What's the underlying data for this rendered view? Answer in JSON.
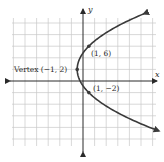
{
  "chart_data": {
    "type": "line",
    "title": "",
    "xlabel": "x",
    "ylabel": "y",
    "equation": "x = (y - 2)^2 / 8 - 1",
    "grid": true,
    "grid_step_units": 2,
    "xlim": [
      -12,
      12
    ],
    "ylim": [
      -12,
      12
    ],
    "series": [
      {
        "name": "parabola",
        "opens": "right",
        "y": [
          -8.5,
          -6,
          -4,
          -2,
          0,
          2,
          4,
          6,
          8,
          10,
          11.5
        ],
        "x": [
          12.78,
          7,
          3.5,
          1,
          -0.5,
          -1,
          -0.5,
          1,
          3.5,
          7,
          10.28
        ]
      }
    ],
    "points": [
      {
        "label": "Vertex (−1, 2)",
        "x": -1,
        "y": 2
      },
      {
        "label": "(1, 6)",
        "x": 1,
        "y": 6
      },
      {
        "label": "(1, −2)",
        "x": 1,
        "y": -2
      }
    ],
    "annotations": [
      "Vertex (−1, 2)",
      "(1, 6)",
      "(1, −2)"
    ]
  },
  "labels": {
    "x_axis": "x",
    "y_axis": "y",
    "vertex": "Vertex (−1, 2)",
    "point_upper": "(1, 6)",
    "point_lower": "(1, −2)"
  },
  "colors": {
    "curve": "#3a3a3a",
    "axis": "#2a2a2a",
    "grid": "#c9c9c9"
  }
}
